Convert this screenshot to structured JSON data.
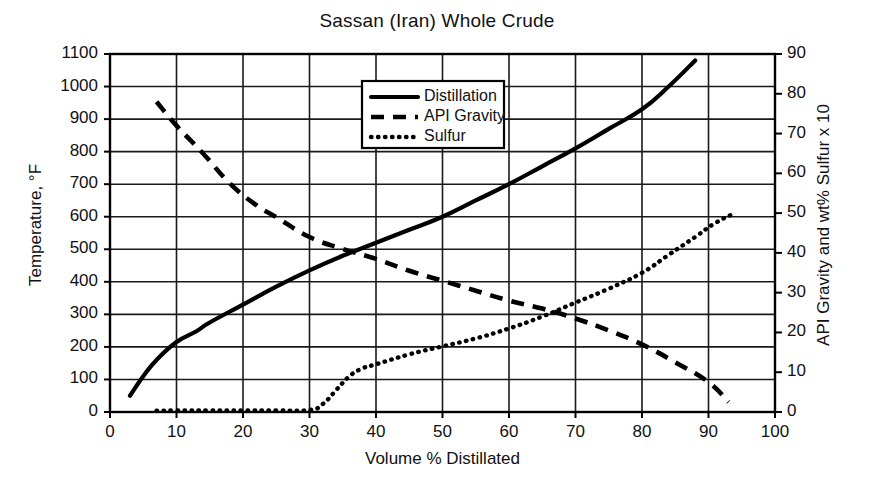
{
  "chart_data": {
    "type": "line",
    "title": "Sassan (Iran) Whole Crude",
    "xlabel": "Volume % Distillated",
    "ylabel": "Temperature, °F",
    "ylabel_right": "API Gravity and wt% Sulfur x 10",
    "xlim": [
      0,
      100
    ],
    "ylim": [
      0,
      1100
    ],
    "ylim_right": [
      0,
      90
    ],
    "xticks": [
      0,
      10,
      20,
      30,
      40,
      50,
      60,
      70,
      80,
      90,
      100
    ],
    "yticks": [
      0,
      100,
      200,
      300,
      400,
      500,
      600,
      700,
      800,
      900,
      1000,
      1100
    ],
    "yticks_right": [
      0,
      10,
      20,
      30,
      40,
      50,
      60,
      70,
      80,
      90
    ],
    "grid": true,
    "legend_position": "upper center",
    "series": [
      {
        "name": "Distillation",
        "style": "solid",
        "axis": "left",
        "color": "#000000",
        "points": [
          [
            3,
            50
          ],
          [
            5,
            110
          ],
          [
            7,
            160
          ],
          [
            10,
            215
          ],
          [
            13,
            248
          ],
          [
            15,
            275
          ],
          [
            20,
            330
          ],
          [
            25,
            385
          ],
          [
            30,
            435
          ],
          [
            35,
            480
          ],
          [
            40,
            520
          ],
          [
            45,
            560
          ],
          [
            50,
            600
          ],
          [
            55,
            650
          ],
          [
            60,
            700
          ],
          [
            65,
            755
          ],
          [
            70,
            810
          ],
          [
            75,
            870
          ],
          [
            80,
            930
          ],
          [
            84,
            1000
          ],
          [
            88,
            1080
          ]
        ]
      },
      {
        "name": "API Gravity",
        "style": "dashed",
        "axis": "right",
        "color": "#000000",
        "points": [
          [
            7,
            78.0
          ],
          [
            10,
            72.0
          ],
          [
            14,
            65.0
          ],
          [
            18,
            57.5
          ],
          [
            22,
            52.0
          ],
          [
            25,
            49.0
          ],
          [
            30,
            44.0
          ],
          [
            35,
            41.0
          ],
          [
            40,
            38.5
          ],
          [
            45,
            35.5
          ],
          [
            50,
            33.0
          ],
          [
            55,
            30.5
          ],
          [
            60,
            28.0
          ],
          [
            65,
            26.0
          ],
          [
            70,
            23.5
          ],
          [
            75,
            20.5
          ],
          [
            80,
            17.0
          ],
          [
            85,
            12.5
          ],
          [
            90,
            7.5
          ],
          [
            93,
            2.5
          ]
        ]
      },
      {
        "name": "Sulfur",
        "style": "dotted",
        "axis": "right",
        "color": "#000000",
        "points": [
          [
            7,
            0.3
          ],
          [
            10,
            0.4
          ],
          [
            15,
            0.4
          ],
          [
            20,
            0.4
          ],
          [
            25,
            0.4
          ],
          [
            30,
            0.5
          ],
          [
            32,
            2.0
          ],
          [
            34,
            5.5
          ],
          [
            36,
            9.0
          ],
          [
            38,
            11.0
          ],
          [
            40,
            12.0
          ],
          [
            45,
            14.5
          ],
          [
            50,
            16.5
          ],
          [
            55,
            18.5
          ],
          [
            60,
            21.0
          ],
          [
            65,
            24.0
          ],
          [
            70,
            27.5
          ],
          [
            75,
            31.0
          ],
          [
            80,
            35.0
          ],
          [
            84,
            39.5
          ],
          [
            88,
            44.0
          ],
          [
            91,
            47.5
          ],
          [
            94,
            50.0
          ]
        ]
      }
    ]
  },
  "legend": {
    "items": [
      {
        "label": "Distillation",
        "style": "solid"
      },
      {
        "label": "API Gravity",
        "style": "dashed"
      },
      {
        "label": "Sulfur",
        "style": "dotted"
      }
    ]
  },
  "colors": {
    "line": "#000000",
    "grid": "#1a1a1a",
    "frame": "#000000",
    "background": "#ffffff"
  }
}
